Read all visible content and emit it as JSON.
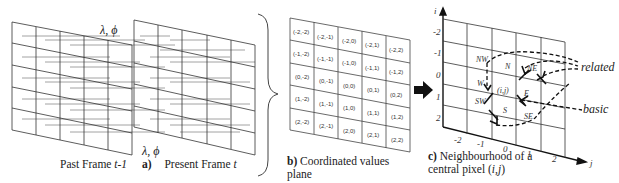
{
  "panel_a": {
    "label_letter": "a)",
    "past_frame_label": "Past Frame ",
    "past_frame_var": "t-1",
    "present_frame_label": "Present Frame ",
    "present_frame_var": "t",
    "top_symbol": "λ, ϕ",
    "bottom_symbol": "λ, ϕ"
  },
  "panel_b": {
    "label_letter": "b)",
    "caption_line1": " Coordinated values",
    "caption_line2": "plane",
    "grid": [
      [
        "(-2,-2)",
        "(-2,-1)",
        "(-2,0)",
        "(-2,1)",
        "(-2,2)"
      ],
      [
        "(-1,-2)",
        "(-1,-1)",
        "(-1,0)",
        "(-1,1)",
        "(-1,2)"
      ],
      [
        "(0,-2)",
        "(0,-1)",
        "(0,0)",
        "(0,1)",
        "(0,2)"
      ],
      [
        "(1,-2)",
        "(1,-1)",
        "(1,0)",
        "(1,1)",
        "(1,2)"
      ],
      [
        "(2,-2)",
        "(2,-1)",
        "(2,0)",
        "(2,1)",
        "(2,2)"
      ]
    ]
  },
  "panel_c": {
    "label_letter": "c)",
    "caption_line1": " Neighbourhood of a",
    "caption_line2_prefix": "central pixel (",
    "caption_line2_var": "i,j",
    "caption_line2_suffix": ")",
    "axis_i": "i",
    "axis_j": "j",
    "i_ticks": [
      "-2",
      "-1",
      "0",
      "1",
      "2"
    ],
    "j_ticks": [
      "-2",
      "-1",
      "0",
      "1",
      "2"
    ],
    "center_label": "(i,j)",
    "directions": [
      "NW",
      "N",
      "NE",
      "W",
      "E",
      "SW",
      "S",
      "SE"
    ],
    "legend_related": "related",
    "legend_basic": "basic"
  },
  "colors": {
    "line": "#222222",
    "grid_line": "#333333",
    "hatch": "#8a8a8a"
  }
}
